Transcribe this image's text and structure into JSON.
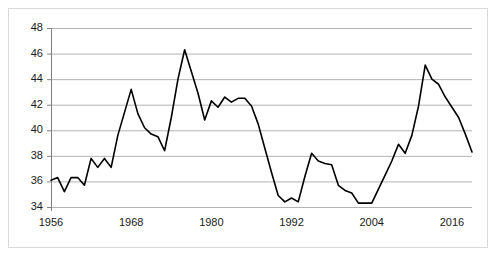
{
  "chart_data": {
    "type": "line",
    "title": "",
    "subtitle": "",
    "xlabel": "",
    "ylabel": "",
    "xlim": [
      1956,
      2019
    ],
    "ylim": [
      34,
      48
    ],
    "grid": "horizontal",
    "legend": "none",
    "line_color": "#000000",
    "grid_color": "#b3b3b3",
    "axis_color": "#808080",
    "background": "#ffffff",
    "yticks": [
      34,
      36,
      38,
      40,
      42,
      44,
      46,
      48
    ],
    "xticks": [
      1956,
      1968,
      1980,
      1992,
      2004,
      2016
    ],
    "ytick_labels": [
      "34",
      "36",
      "38",
      "40",
      "42",
      "44",
      "46",
      "48"
    ],
    "xtick_labels": [
      "1956",
      "1968",
      "1980",
      "1992",
      "2004",
      "2016"
    ],
    "series": [
      {
        "name": "value",
        "x": [
          1956,
          1957,
          1958,
          1959,
          1960,
          1961,
          1962,
          1963,
          1964,
          1965,
          1966,
          1967,
          1968,
          1969,
          1970,
          1971,
          1972,
          1973,
          1974,
          1975,
          1976,
          1977,
          1978,
          1979,
          1980,
          1981,
          1982,
          1983,
          1984,
          1985,
          1986,
          1987,
          1988,
          1989,
          1990,
          1991,
          1992,
          1993,
          1994,
          1995,
          1996,
          1997,
          1998,
          1999,
          2000,
          2001,
          2002,
          2003,
          2004,
          2005,
          2006,
          2007,
          2008,
          2009,
          2010,
          2011,
          2012,
          2013,
          2014,
          2015,
          2016,
          2017,
          2018,
          2019
        ],
        "values": [
          36.1,
          36.3,
          35.2,
          36.3,
          36.3,
          35.7,
          37.8,
          37.1,
          37.8,
          37.1,
          39.6,
          41.4,
          43.2,
          41.3,
          40.2,
          39.7,
          39.5,
          38.4,
          41.0,
          44.0,
          46.3,
          44.6,
          42.9,
          40.8,
          42.3,
          41.8,
          42.6,
          42.2,
          42.5,
          42.5,
          41.9,
          40.5,
          38.6,
          36.7,
          34.9,
          34.4,
          34.7,
          34.4,
          36.4,
          38.2,
          37.6,
          37.4,
          37.3,
          35.7,
          35.3,
          35.1,
          34.3,
          34.3,
          34.3,
          35.4,
          36.5,
          37.6,
          38.9,
          38.2,
          39.6,
          41.9,
          45.1,
          44.0,
          43.6,
          42.6,
          41.8,
          41.0,
          39.7,
          38.3
        ]
      }
    ]
  },
  "axes": {
    "y_title": "",
    "x_title": ""
  }
}
